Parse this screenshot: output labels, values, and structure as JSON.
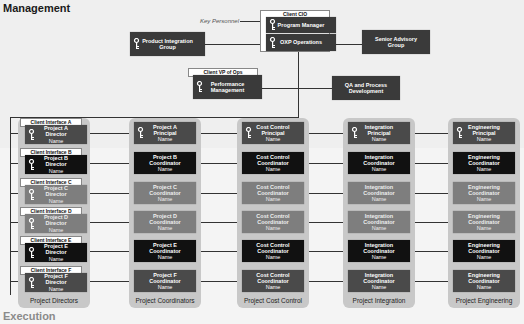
{
  "sections": {
    "management": "Management",
    "execution": "Execution"
  },
  "key_personnel_label": "Key Personnel",
  "management": {
    "client_cio": "Client CIO",
    "program_manager": "Program Manager",
    "oxp_operations": "OXP Operations",
    "product_integration": [
      "Product Integration",
      "Group"
    ],
    "senior_advisory": [
      "Senior Advisory",
      "Group"
    ],
    "client_vp_ops": "Client VP of Ops",
    "performance_mgmt": [
      "Performance",
      "Management"
    ],
    "qa_process": [
      "QA and Process",
      "Development"
    ]
  },
  "columns": [
    {
      "label": "Project Directors",
      "rows": [
        {
          "tag": "Client Interface A",
          "l1": "Project A",
          "l2": "Director",
          "l3": "Name",
          "shade": "mid",
          "key": true
        },
        {
          "tag": "Client Interface B",
          "l1": "Project B",
          "l2": "Director",
          "l3": "Name",
          "shade": "black",
          "key": true
        },
        {
          "tag": "Client Interface C",
          "l1": "Project C",
          "l2": "Director",
          "l3": "Name",
          "shade": "light",
          "key": true
        },
        {
          "tag": "Client Interface D",
          "l1": "Project D",
          "l2": "Director",
          "l3": "Name",
          "shade": "light",
          "key": true
        },
        {
          "tag": "Client Interface E",
          "l1": "Project E",
          "l2": "Director",
          "l3": "Name",
          "shade": "black",
          "key": true
        },
        {
          "tag": "Client Interface F",
          "l1": "Project F",
          "l2": "Director",
          "l3": "Name",
          "shade": "mid",
          "key": true
        }
      ]
    },
    {
      "label": "Project Coordinators",
      "rows": [
        {
          "l1": "Project A",
          "l2": "Principal",
          "l3": "Name",
          "shade": "mid",
          "key": true
        },
        {
          "l1": "Project B",
          "l2": "Coordinator",
          "l3": "Name",
          "shade": "black"
        },
        {
          "l1": "Project C",
          "l2": "Coordinator",
          "l3": "Name",
          "shade": "light"
        },
        {
          "l1": "Project D",
          "l2": "Coordinator",
          "l3": "Name",
          "shade": "light"
        },
        {
          "l1": "Project E",
          "l2": "Coordinator",
          "l3": "Name",
          "shade": "black"
        },
        {
          "l1": "Project F",
          "l2": "Coordinator",
          "l3": "Name",
          "shade": "mid"
        }
      ]
    },
    {
      "label": "Project Cost Control",
      "rows": [
        {
          "l1": "Cost Control",
          "l2": "Principal",
          "l3": "Name",
          "shade": "mid",
          "key": true
        },
        {
          "l1": "Cost Control",
          "l2": "Coordinator",
          "l3": "Name",
          "shade": "black"
        },
        {
          "l1": "Cost Control",
          "l2": "Coordinator",
          "l3": "Name",
          "shade": "light"
        },
        {
          "l1": "Cost Control",
          "l2": "Coordinator",
          "l3": "Name",
          "shade": "light"
        },
        {
          "l1": "Cost Control",
          "l2": "Coordinator",
          "l3": "Name",
          "shade": "black"
        },
        {
          "l1": "Cost Control",
          "l2": "Coordinator",
          "l3": "Name",
          "shade": "mid"
        }
      ]
    },
    {
      "label": "Project Integration",
      "rows": [
        {
          "l1": "Integration",
          "l2": "Principal",
          "l3": "Name",
          "shade": "mid",
          "key": true
        },
        {
          "l1": "Integration",
          "l2": "Coordinator",
          "l3": "Name",
          "shade": "black"
        },
        {
          "l1": "Integration",
          "l2": "Coordinator",
          "l3": "Name",
          "shade": "light"
        },
        {
          "l1": "Integration",
          "l2": "Coordinator",
          "l3": "Name",
          "shade": "light"
        },
        {
          "l1": "Integration",
          "l2": "Coordinator",
          "l3": "Name",
          "shade": "black"
        },
        {
          "l1": "Integration",
          "l2": "Coordinator",
          "l3": "Name",
          "shade": "mid"
        }
      ]
    },
    {
      "label": "Project Engineering",
      "rows": [
        {
          "l1": "Engineering",
          "l2": "Principal",
          "l3": "Name",
          "shade": "mid",
          "key": true
        },
        {
          "l1": "Engineering",
          "l2": "Coordinator",
          "l3": "Name",
          "shade": "black"
        },
        {
          "l1": "Engineering",
          "l2": "Coordinator",
          "l3": "Name",
          "shade": "light"
        },
        {
          "l1": "Engineering",
          "l2": "Coordinator",
          "l3": "Name",
          "shade": "light"
        },
        {
          "l1": "Engineering",
          "l2": "Coordinator",
          "l3": "Name",
          "shade": "black"
        },
        {
          "l1": "Engineering",
          "l2": "Coordinator",
          "l3": "Name",
          "shade": "mid"
        }
      ]
    }
  ]
}
